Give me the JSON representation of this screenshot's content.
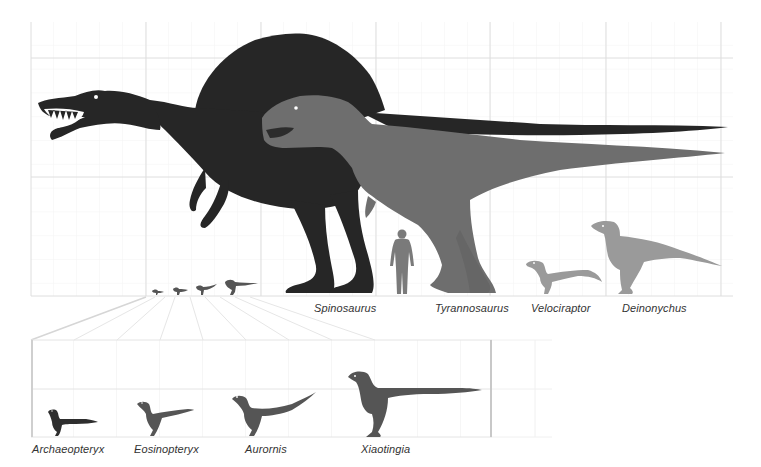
{
  "figure": {
    "colors": {
      "spinosaurus": "#262626",
      "tyrannosaurus": "#6e6e6e",
      "small_raptors": "#9a9a9a",
      "human": "#7a7a7a",
      "paravians_dark": "#333333",
      "paravians_mid": "#555555",
      "grid_major": "#dcdcdc",
      "grid_minor": "#f2f2f2",
      "label": "#333333"
    },
    "main_panel": {
      "species": [
        {
          "name": "Spinosaurus",
          "label_x": 314,
          "label_y": 302
        },
        {
          "name": "Tyrannosaurus",
          "label_x": 435,
          "label_y": 302
        },
        {
          "name": "Velociraptor",
          "label_x": 531,
          "label_y": 302
        },
        {
          "name": "Deinonychus",
          "label_x": 622,
          "label_y": 302
        }
      ],
      "human_scale_figure": "human-silhouette"
    },
    "inset_panel": {
      "species": [
        {
          "name": "Archaeopteryx",
          "label_x": 32,
          "label_y": 443
        },
        {
          "name": "Eosinopteryx",
          "label_x": 134,
          "label_y": 443
        },
        {
          "name": "Aurornis",
          "label_x": 245,
          "label_y": 443
        },
        {
          "name": "Xiaotingia",
          "label_x": 361,
          "label_y": 443
        }
      ]
    }
  }
}
